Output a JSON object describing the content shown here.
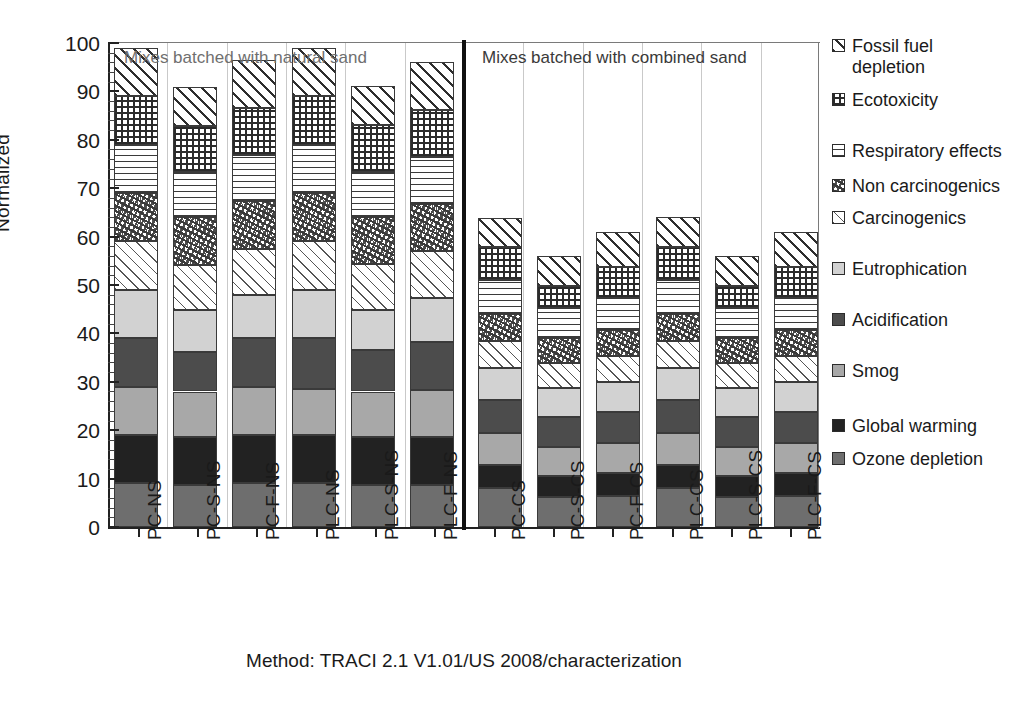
{
  "chart_data": {
    "type": "bar",
    "stacked": true,
    "title": "",
    "xlabel": "",
    "ylabel": "Normalized",
    "ylim": [
      0,
      100
    ],
    "yticks": [
      0,
      10,
      20,
      30,
      40,
      50,
      60,
      70,
      80,
      90,
      100
    ],
    "grid": "vertical-only",
    "legend_position": "right",
    "caption": "Method: TRACI 2.1 V1.01/US 2008/characterization",
    "annotations": [
      "Mixes batched with natural sand",
      "Mixes batched with combined sand"
    ],
    "categories": [
      "PC-NS",
      "PC-S-NS",
      "PC-F-NS",
      "PLC-NS",
      "PLC-S-NS",
      "PLC-F-NS",
      "PC-CS",
      "PC-S-CS",
      "PC-F-CS",
      "PLC-CS",
      "PLC-S-CS",
      "PLC-F-CS"
    ],
    "series": [
      {
        "name": "Ozone depletion",
        "pattern": "solid-gray-medium",
        "color": "#6e6e6e",
        "values": [
          9.1,
          8.7,
          9.1,
          9.1,
          8.7,
          8.7,
          8.0,
          6.2,
          6.5,
          8.0,
          6.2,
          6.5
        ]
      },
      {
        "name": "Global warming",
        "pattern": "solid-near-black",
        "color": "#222222",
        "values": [
          9.9,
          10.0,
          9.9,
          9.9,
          10.0,
          10.0,
          4.8,
          4.4,
          4.6,
          4.8,
          4.4,
          4.6
        ]
      },
      {
        "name": "Smog",
        "pattern": "solid-gray-light",
        "color": "#a8a8a8",
        "values": [
          10.0,
          9.3,
          10.0,
          9.6,
          9.3,
          9.6,
          6.6,
          5.9,
          6.2,
          6.6,
          5.9,
          6.2
        ]
      },
      {
        "name": "Acidification",
        "pattern": "solid-gray-dark",
        "color": "#4c4c4c",
        "values": [
          10.0,
          8.2,
          10.0,
          10.4,
          8.6,
          10.0,
          6.8,
          6.2,
          6.5,
          6.8,
          6.2,
          6.5
        ]
      },
      {
        "name": "Eutrophication",
        "pattern": "solid-gray-pale",
        "color": "#d2d2d2",
        "values": [
          10.0,
          8.6,
          8.9,
          10.0,
          8.2,
          9.1,
          6.6,
          6.0,
          6.2,
          6.6,
          6.0,
          6.2
        ]
      },
      {
        "name": "Carcinogenics",
        "pattern": "fine-diagonal-hatch",
        "color": "#555555",
        "values": [
          10.0,
          9.4,
          9.6,
          10.0,
          9.5,
          9.6,
          5.6,
          5.1,
          5.3,
          5.6,
          5.1,
          5.3
        ]
      },
      {
        "name": "Non carcinogenics",
        "pattern": "speckle",
        "color": "#4a4a4a",
        "values": [
          10.0,
          9.8,
          9.8,
          10.0,
          9.8,
          9.8,
          5.7,
          5.2,
          5.4,
          5.7,
          5.2,
          5.4
        ]
      },
      {
        "name": "Respiratory effects",
        "pattern": "horizontal-lines",
        "color": "#3a3a3a",
        "values": [
          10.0,
          9.3,
          9.6,
          10.0,
          9.3,
          9.6,
          6.9,
          6.3,
          6.6,
          6.9,
          6.3,
          6.6
        ]
      },
      {
        "name": "Ecotoxicity",
        "pattern": "checker-dots",
        "color": "#2b2b2b",
        "values": [
          10.0,
          9.6,
          9.7,
          10.0,
          9.6,
          9.7,
          6.8,
          4.5,
          6.4,
          6.8,
          4.5,
          6.4
        ]
      },
      {
        "name": "Fossil fuel depletion",
        "pattern": "bold-diagonal-hatch",
        "color": "#2e2e2e",
        "values": [
          10.0,
          8.1,
          9.9,
          10.0,
          8.1,
          9.9,
          6.0,
          6.2,
          7.3,
          6.3,
          6.2,
          7.3
        ]
      }
    ],
    "totals": [
      100,
      91,
      96.5,
      100,
      91,
      96.5,
      64,
      56,
      61,
      64,
      56,
      61
    ]
  },
  "axis": {
    "y_label": "Normalized",
    "y_ticks": [
      "100",
      "90",
      "80",
      "70",
      "60",
      "50",
      "40",
      "30",
      "20",
      "10",
      "0"
    ],
    "x_labels": [
      "PC-NS",
      "PC-S-NS",
      "PC-F-NS",
      "PLC-NS",
      "PLC-S-NS",
      "PLC-F-NS",
      "PC-CS",
      "PC-S-CS",
      "PC-F-CS",
      "PLC-CS",
      "PLC-S-CS",
      "PLC-F-CS"
    ]
  },
  "annotations": {
    "natural_sand": "Mixes batched with natural sand",
    "combined_sand": "Mixes batched with combined sand"
  },
  "caption": {
    "text": "Method: TRACI 2.1 V1.01/US 2008/characterization"
  },
  "legend": {
    "items": [
      {
        "label": "Fossil fuel depletion",
        "key": "fossil"
      },
      {
        "label": "Ecotoxicity",
        "key": "ecotox"
      },
      {
        "label": "Respiratory effects",
        "key": "resp"
      },
      {
        "label": "Non carcinogenics",
        "key": "noncarc"
      },
      {
        "label": "Carcinogenics",
        "key": "carc"
      },
      {
        "label": "Eutrophication",
        "key": "eutro"
      },
      {
        "label": "Acidification",
        "key": "acid"
      },
      {
        "label": "Smog",
        "key": "smog"
      },
      {
        "label": "Global warming",
        "key": "gw"
      },
      {
        "label": "Ozone depletion",
        "key": "ozone"
      }
    ]
  },
  "colors": {
    "axis": "#222222",
    "grid": "#c9c9c9",
    "divider": "#111111",
    "note_light": "#6f6f6f",
    "note_dark": "#3a3a3a"
  }
}
